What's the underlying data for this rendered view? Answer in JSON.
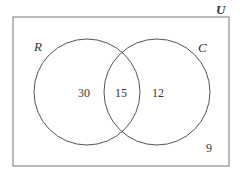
{
  "diagram": {
    "type": "venn",
    "universe_label": "U",
    "sets": [
      {
        "label": "R",
        "only": "30"
      },
      {
        "label": "C",
        "only": "12"
      }
    ],
    "intersection": "15",
    "outside": "9",
    "colors": {
      "stroke": "#555555",
      "text": "#333333",
      "background": "#ffffff"
    }
  }
}
